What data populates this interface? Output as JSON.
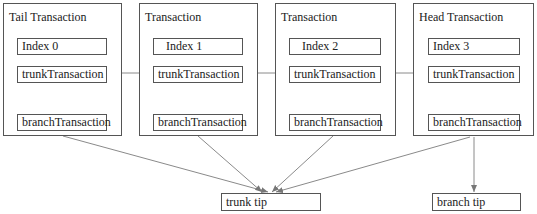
{
  "diagram": {
    "transactions": [
      {
        "title": "Tail Transaction",
        "index": "Index 0",
        "trunk": "trunkTransaction",
        "branch": "branchTransaction"
      },
      {
        "title": "Transaction",
        "index": "Index 1",
        "trunk": "trunkTransaction",
        "branch": "branchTransaction"
      },
      {
        "title": "Transaction",
        "index": "Index 2",
        "trunk": "trunkTransaction",
        "branch": "branchTransaction"
      },
      {
        "title": "Head Transaction",
        "index": "Index 3",
        "trunk": "trunkTransaction",
        "branch": "branchTransaction"
      }
    ],
    "tips": {
      "trunk": "trunk tip",
      "branch": "branch tip"
    },
    "edges": [
      {
        "from": "Index 0 trunkTransaction",
        "to": "Index 1 trunkTransaction"
      },
      {
        "from": "Index 1 trunkTransaction",
        "to": "Index 2 trunkTransaction"
      },
      {
        "from": "Index 2 trunkTransaction",
        "to": "Index 3 trunkTransaction"
      },
      {
        "from": "Tail Transaction",
        "to": "trunk tip"
      },
      {
        "from": "Transaction (Index 1)",
        "to": "trunk tip"
      },
      {
        "from": "Transaction (Index 2)",
        "to": "trunk tip"
      },
      {
        "from": "Head Transaction",
        "to": "trunk tip"
      },
      {
        "from": "Head Transaction",
        "to": "branch tip"
      }
    ],
    "colors": {
      "border": "#555555",
      "edge": "#8a8a8a"
    }
  }
}
